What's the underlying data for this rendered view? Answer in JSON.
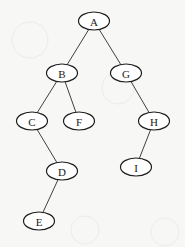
{
  "diagram": {
    "type": "binary-tree",
    "node_rx": 15.5,
    "node_ry": 9,
    "nodes": [
      {
        "id": "A",
        "label": "A",
        "x": 94,
        "y": 21
      },
      {
        "id": "B",
        "label": "B",
        "x": 62,
        "y": 73
      },
      {
        "id": "G",
        "label": "G",
        "x": 126,
        "y": 73
      },
      {
        "id": "C",
        "label": "C",
        "x": 32,
        "y": 121
      },
      {
        "id": "F",
        "label": "F",
        "x": 79,
        "y": 121
      },
      {
        "id": "H",
        "label": "H",
        "x": 154,
        "y": 121
      },
      {
        "id": "D",
        "label": "D",
        "x": 62,
        "y": 171
      },
      {
        "id": "I",
        "label": "I",
        "x": 136,
        "y": 167
      },
      {
        "id": "E",
        "label": "E",
        "x": 39,
        "y": 221
      }
    ],
    "edges": [
      {
        "from": "A",
        "to": "B"
      },
      {
        "from": "A",
        "to": "G"
      },
      {
        "from": "B",
        "to": "C"
      },
      {
        "from": "B",
        "to": "F"
      },
      {
        "from": "G",
        "to": "H"
      },
      {
        "from": "C",
        "to": "D"
      },
      {
        "from": "H",
        "to": "I"
      },
      {
        "from": "D",
        "to": "E"
      }
    ]
  }
}
